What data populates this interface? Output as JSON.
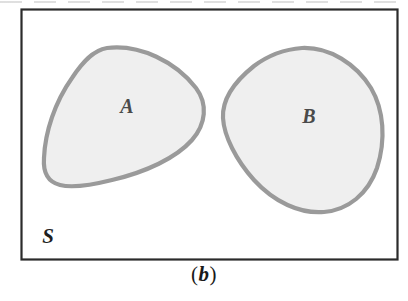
{
  "figure": {
    "kind": "set-diagram",
    "caption_open_paren": "(",
    "caption_letter": "b",
    "caption_close_paren": ")",
    "caption_full": "(b)",
    "universe_label": "S",
    "regions": [
      {
        "id": "A",
        "label": "A",
        "relation": "disjoint"
      },
      {
        "id": "B",
        "label": "B",
        "relation": "disjoint"
      }
    ],
    "colors": {
      "frame_stroke": "#2b2b2b",
      "blob_stroke": "#9a9a9a",
      "blob_fill": "#efefef",
      "label_color": "#4a4a4a",
      "universe_label_color": "#1f1f1f",
      "background": "#ffffff"
    },
    "geometry": {
      "frame": {
        "x": 21,
        "y": 9,
        "width": 376,
        "height": 250
      },
      "label_A": {
        "x": 127,
        "y": 113
      },
      "label_B": {
        "x": 309,
        "y": 123
      },
      "label_S": {
        "x": 48,
        "y": 243
      }
    }
  }
}
